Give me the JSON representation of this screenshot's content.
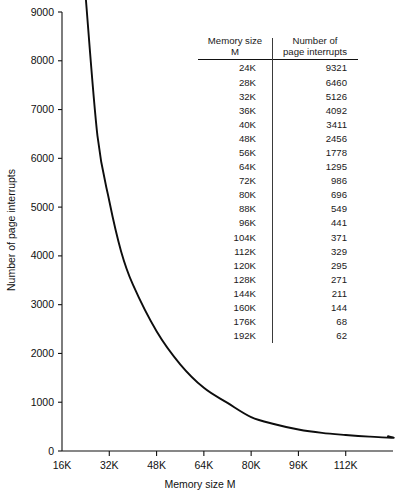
{
  "chart_data": {
    "type": "line",
    "title": "",
    "xlabel": "Memory size M",
    "ylabel": "Number of page interrupts",
    "xlim": [
      16,
      128
    ],
    "ylim": [
      0,
      9000
    ],
    "grid": false,
    "legend": "none",
    "x_tick_labels": [
      "16K",
      "32K",
      "48K",
      "64K",
      "80K",
      "96K",
      "112K"
    ],
    "x_tick_values": [
      16,
      32,
      48,
      64,
      80,
      96,
      112
    ],
    "y_tick_labels": [
      "0",
      "1000",
      "2000",
      "3000",
      "4000",
      "5000",
      "6000",
      "7000",
      "8000",
      "9000"
    ],
    "y_tick_values": [
      0,
      1000,
      2000,
      3000,
      4000,
      5000,
      6000,
      7000,
      8000,
      9000
    ],
    "series": [
      {
        "name": "page interrupts",
        "x": [
          24,
          28,
          32,
          36,
          40,
          48,
          56,
          64,
          72,
          80,
          88,
          96,
          104,
          112,
          120,
          128,
          144,
          160,
          176,
          192
        ],
        "values": [
          9321,
          6460,
          5126,
          4092,
          3411,
          2456,
          1778,
          1295,
          986,
          696,
          549,
          441,
          371,
          329,
          295,
          271,
          211,
          144,
          68,
          62
        ]
      }
    ]
  },
  "table": {
    "header": {
      "col1_line1": "Memory size",
      "col1_line2": "M",
      "col2_line1": "Number of",
      "col2_line2": "page interrupts"
    },
    "rows": [
      {
        "memory": "24K",
        "interrupts": "9321"
      },
      {
        "memory": "28K",
        "interrupts": "6460"
      },
      {
        "memory": "32K",
        "interrupts": "5126"
      },
      {
        "memory": "36K",
        "interrupts": "4092"
      },
      {
        "memory": "40K",
        "interrupts": "3411"
      },
      {
        "memory": "48K",
        "interrupts": "2456"
      },
      {
        "memory": "56K",
        "interrupts": "1778"
      },
      {
        "memory": "64K",
        "interrupts": "1295"
      },
      {
        "memory": "72K",
        "interrupts": "986"
      },
      {
        "memory": "80K",
        "interrupts": "696"
      },
      {
        "memory": "88K",
        "interrupts": "549"
      },
      {
        "memory": "96K",
        "interrupts": "441"
      },
      {
        "memory": "104K",
        "interrupts": "371"
      },
      {
        "memory": "112K",
        "interrupts": "329"
      },
      {
        "memory": "120K",
        "interrupts": "295"
      },
      {
        "memory": "128K",
        "interrupts": "271"
      },
      {
        "memory": "144K",
        "interrupts": "211"
      },
      {
        "memory": "160K",
        "interrupts": "144"
      },
      {
        "memory": "176K",
        "interrupts": "68"
      },
      {
        "memory": "192K",
        "interrupts": "62"
      }
    ]
  },
  "colors": {
    "curve": "#0d0d0d",
    "axis": "#111111",
    "background": "#ffffff",
    "divider": "#3a3a3a"
  }
}
